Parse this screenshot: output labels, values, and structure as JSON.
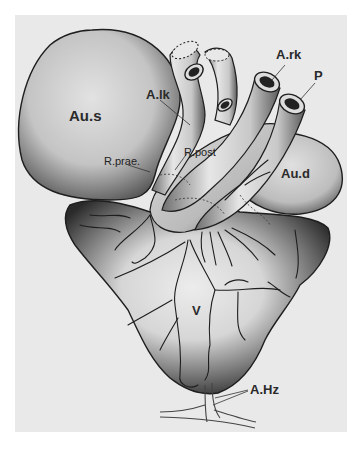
{
  "figure": {
    "background": "#e9e9e9",
    "stroke": "#1e1e1e",
    "labels": {
      "au_s": "Au.s",
      "a_lk": "A.lk",
      "a_rk": "A.rk",
      "p": "P",
      "r_prae": "R.prae.",
      "r_post": "R.post",
      "au_d": "Au.d",
      "v": "V",
      "a_hz": "A.Hz"
    }
  }
}
